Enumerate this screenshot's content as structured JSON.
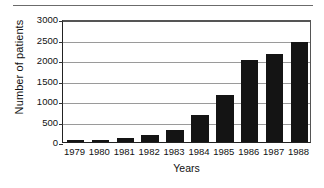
{
  "chart_data": {
    "type": "bar",
    "title": "",
    "xlabel": "Years",
    "ylabel": "Number of patients",
    "categories": [
      "1979",
      "1980",
      "1981",
      "1982",
      "1983",
      "1984",
      "1985",
      "1986",
      "1987",
      "1988"
    ],
    "values": [
      50,
      60,
      100,
      180,
      300,
      670,
      1140,
      2000,
      2150,
      2430
    ],
    "ylim": [
      0,
      3000
    ],
    "yticks": [
      0,
      500,
      1000,
      1500,
      2000,
      2500,
      3000
    ],
    "ytick_labels": [
      "0",
      "500",
      "1000",
      "1500",
      "2000",
      "2500",
      "3000"
    ],
    "grid": true,
    "legend": false,
    "bar_color": "#141414",
    "grid_color": "#9a9a9a",
    "axis_color": "#222222"
  }
}
